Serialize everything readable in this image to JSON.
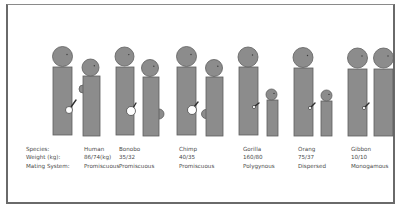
{
  "colors": {
    "figure_fill": "#8c8c8c",
    "figure_stroke": "#5e5e5e",
    "marker_fill": "#ffffff",
    "text": "#4a4a4a",
    "frame": "#6a6a6a"
  },
  "row_labels": {
    "species": "Species:",
    "weight": "Weight (kg):",
    "mating": "Mating System:"
  },
  "species": [
    {
      "name": "Human",
      "weight": "86/74(kg)",
      "mating_system": "Promiscuous",
      "male": {
        "head": [
          62.5,
          56.5,
          10
        ],
        "body": [
          53,
          67,
          19,
          68
        ],
        "marker": {
          "type": "circle-line",
          "cx": 69,
          "cy": 110,
          "r": 3.5,
          "line": [
            71,
            107,
            76,
            100
          ]
        }
      },
      "female": {
        "head": [
          90.5,
          67.5,
          8.5
        ],
        "body": [
          83,
          76,
          17,
          60
        ],
        "bump": {
          "side": "left",
          "cx": 83,
          "cy": 89,
          "r": 4
        }
      }
    },
    {
      "name": "Bonobo",
      "weight": "35/32",
      "mating_system": "Promiscuous",
      "male": {
        "head": [
          124.5,
          56.5,
          9.5
        ],
        "body": [
          116,
          67,
          18,
          68
        ],
        "marker": {
          "type": "circle-line",
          "cx": 131,
          "cy": 111,
          "r": 4.5,
          "line": [
            133,
            108,
            136,
            103
          ]
        }
      },
      "female": {
        "head": [
          150,
          68,
          8.5
        ],
        "body": [
          143,
          77,
          16,
          59
        ],
        "bump": {
          "side": "right",
          "cx": 159,
          "cy": 114,
          "r": 5
        }
      }
    },
    {
      "name": "Chimp",
      "weight": "40/35",
      "mating_system": "Promiscuous",
      "male": {
        "head": [
          186.5,
          56.5,
          10
        ],
        "body": [
          177,
          67,
          19,
          68
        ],
        "marker": {
          "type": "circle-line",
          "cx": 192,
          "cy": 110,
          "r": 4.5,
          "line": [
            194,
            107,
            198,
            102
          ]
        }
      },
      "female": {
        "head": [
          214,
          68,
          8.5
        ],
        "body": [
          206,
          77,
          17,
          59
        ],
        "bump": {
          "side": "left",
          "cx": 206,
          "cy": 114,
          "r": 4.5
        }
      }
    },
    {
      "name": "Gorilla",
      "weight": "160/80",
      "mating_system": "Polygynous",
      "male": {
        "head": [
          248,
          57,
          10
        ],
        "body": [
          239,
          67,
          19,
          68
        ],
        "marker": {
          "type": "dot-line",
          "cx": 254,
          "cy": 107,
          "r": 1.6,
          "line": [
            255,
            106,
            259,
            103
          ]
        }
      },
      "female": {
        "head": [
          271.5,
          94.5,
          5.5
        ],
        "body": [
          267,
          100,
          11,
          36
        ],
        "bump": null
      }
    },
    {
      "name": "Orang",
      "weight": "75/37",
      "mating_system": "Dispersed",
      "male": {
        "head": [
          303,
          57.5,
          10
        ],
        "body": [
          294,
          68,
          19,
          68
        ],
        "marker": {
          "type": "dot-line",
          "cx": 310,
          "cy": 108,
          "r": 1.6,
          "line": [
            311,
            107,
            315,
            103
          ]
        }
      },
      "female": {
        "head": [
          326.5,
          95.5,
          5.5
        ],
        "body": [
          321,
          101,
          11,
          35
        ],
        "bump": null
      }
    },
    {
      "name": "Gibbon",
      "weight": "10/10",
      "mating_system": "Monogamous",
      "male": {
        "head": [
          357.5,
          58,
          10
        ],
        "body": [
          348,
          69,
          19,
          67
        ],
        "marker": {
          "type": "dot-line",
          "cx": 364,
          "cy": 108,
          "r": 1.6,
          "line": [
            365,
            107,
            369,
            103
          ]
        }
      },
      "female": {
        "head": [
          383.5,
          58,
          10
        ],
        "body": [
          374,
          69,
          19,
          67
        ],
        "bump": null
      }
    }
  ],
  "label_x": [
    26,
    84,
    143,
    206,
    267,
    324,
    380
  ]
}
